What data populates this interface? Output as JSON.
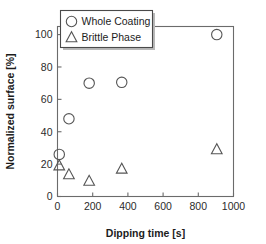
{
  "chart_data": {
    "type": "scatter",
    "title": "",
    "xlabel": "Dipping time [s]",
    "ylabel": "Normalized surface [%]",
    "xlim": [
      0,
      1000
    ],
    "ylim": [
      0,
      105
    ],
    "xticks": [
      0,
      200,
      400,
      600,
      800,
      1000
    ],
    "yticks": [
      0,
      20,
      40,
      60,
      80,
      100
    ],
    "xtick_labels": [
      "0",
      "200",
      "400",
      "600",
      "800",
      "1000"
    ],
    "ytick_labels": [
      "0",
      "20",
      "40",
      "60",
      "80",
      "100"
    ],
    "grid": false,
    "legend_position": "top-left",
    "series": [
      {
        "name": "Whole Coating",
        "marker": "circle",
        "x": [
          10,
          65,
          180,
          365,
          905
        ],
        "y": [
          26,
          48,
          70,
          70.5,
          100
        ]
      },
      {
        "name": "Brittle Phase",
        "marker": "triangle",
        "x": [
          10,
          65,
          180,
          365,
          905
        ],
        "y": [
          19,
          13.5,
          9.5,
          17,
          29
        ]
      }
    ]
  },
  "legend": {
    "entries": [
      {
        "label": "Whole Coating",
        "marker": "circle"
      },
      {
        "label": "Brittle Phase",
        "marker": "triangle"
      }
    ]
  },
  "colors": {
    "marker_stroke": "#555555",
    "axis_stroke": "#6b6b6b",
    "text": "#1c1c1c",
    "background": "#ffffff"
  }
}
